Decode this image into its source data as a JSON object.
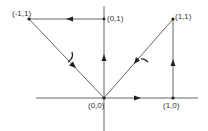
{
  "diagram": {
    "colors": {
      "line": "#555555",
      "arrow": "#222222",
      "text": "#333333"
    },
    "points": [
      {
        "id": "p_m1_1",
        "label": "(-1,1)"
      },
      {
        "id": "p_0_1",
        "label": "(0,1)"
      },
      {
        "id": "p_1_1",
        "label": "(1,1)"
      },
      {
        "id": "p_0_0",
        "label": "(0,0)"
      },
      {
        "id": "p_1_0",
        "label": "(1,0)"
      }
    ],
    "edges": [
      {
        "from": "(0,1)",
        "to": "(-1,1)",
        "direction": "left"
      },
      {
        "from": "(0,0)",
        "to": "(0,1)",
        "direction": "up"
      },
      {
        "from": "(-1,1)",
        "to": "(0,0)",
        "direction": "down-right"
      },
      {
        "from": "(1,1)",
        "to": "(0,0)",
        "direction": "down-left"
      },
      {
        "from": "(1,0)",
        "to": "(1,1)",
        "direction": "up"
      },
      {
        "from": "(0,0)",
        "to": "(1,0)",
        "direction": "right"
      }
    ],
    "arcs": [
      "left-diagonal-angle-mark",
      "right-diagonal-angle-mark"
    ]
  }
}
